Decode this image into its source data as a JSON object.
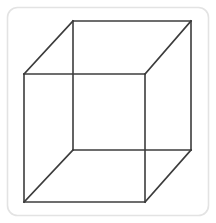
{
  "figure": {
    "name": "Necker cube",
    "caption": "",
    "type": "line-drawing",
    "background_color": "#ffffff",
    "canvas": {
      "width": 216,
      "height": 223
    }
  },
  "frame": {
    "name": "rounded-border-frame",
    "stroke_color": "#e3e3e3",
    "stroke_width": 1.6,
    "corner_radius": 10,
    "x": 7.5,
    "y": 7.5,
    "width": 201,
    "height": 208
  },
  "cube": {
    "stroke_color": "#3c3c3c",
    "stroke_width": 1.6,
    "line_cap": "square",
    "fill": "none",
    "front_face": {
      "label": "front-square",
      "top_left": {
        "x": 24,
        "y": 74
      },
      "top_right": {
        "x": 145,
        "y": 74
      },
      "bottom_right": {
        "x": 145,
        "y": 202
      },
      "bottom_left": {
        "x": 24,
        "y": 202
      }
    },
    "back_face": {
      "label": "back-square",
      "top_left": {
        "x": 73,
        "y": 21
      },
      "top_right": {
        "x": 191,
        "y": 21
      },
      "bottom_right": {
        "x": 191,
        "y": 150
      },
      "bottom_left": {
        "x": 73,
        "y": 150
      }
    },
    "connectors": [
      {
        "label": "connector-top-left",
        "from": "front.top_left",
        "to": "back.top_left",
        "x1": 24,
        "y1": 74,
        "x2": 73,
        "y2": 21
      },
      {
        "label": "connector-top-right",
        "from": "front.top_right",
        "to": "back.top_right",
        "x1": 145,
        "y1": 74,
        "x2": 191,
        "y2": 21
      },
      {
        "label": "connector-bottom-right",
        "from": "front.bottom_right",
        "to": "back.bottom_right",
        "x1": 145,
        "y1": 202,
        "x2": 191,
        "y2": 150
      },
      {
        "label": "connector-bottom-left",
        "from": "front.bottom_left",
        "to": "back.bottom_left",
        "x1": 24,
        "y1": 202,
        "x2": 73,
        "y2": 150
      }
    ]
  }
}
